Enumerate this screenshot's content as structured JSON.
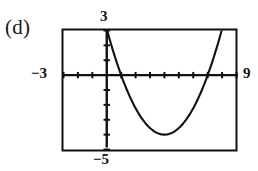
{
  "figure": {
    "part_label": "(d)",
    "type": "graphing-calculator-window"
  },
  "axis_labels": {
    "x_min": "−3",
    "x_max": "9",
    "y_max": "3",
    "y_min": "−5"
  },
  "colors": {
    "ink": "#111111",
    "background": "#ffffff",
    "curve": "#111111"
  },
  "chart_data": {
    "type": "line",
    "title": "",
    "subtitle": "",
    "xlabel": "",
    "ylabel": "",
    "xlim": [
      -3,
      9
    ],
    "ylim": [
      -5,
      3
    ],
    "grid": false,
    "legend": null,
    "x_tick_step": 1,
    "y_tick_step": 1,
    "x_ticks": [
      -3,
      -2,
      -1,
      0,
      1,
      2,
      3,
      4,
      5,
      6,
      7,
      8,
      9
    ],
    "y_ticks": [
      -5,
      -4,
      -3,
      -2,
      -1,
      0,
      1,
      2,
      3
    ],
    "series": [
      {
        "name": "parabola",
        "shape": "upward-parabola",
        "vertex": [
          4,
          -4
        ],
        "roots": [
          1,
          7
        ],
        "leading_coefficient": 0.444,
        "equation": "y = 0.444(x - 4)^2 - 4",
        "x": [
          -0.2,
          0.0,
          0.3,
          0.6,
          1.0,
          1.4,
          1.8,
          2.2,
          2.6,
          3.0,
          3.4,
          3.8,
          4.0,
          4.2,
          4.6,
          5.0,
          5.4,
          5.8,
          6.2,
          6.6,
          7.0,
          7.4,
          7.8,
          8.0
        ],
        "y": [
          4.39,
          3.11,
          2.58,
          1.53,
          0.0,
          -0.89,
          -1.85,
          -2.56,
          -3.13,
          -3.56,
          -3.84,
          -3.98,
          -4.0,
          -3.98,
          -3.84,
          -3.56,
          -3.13,
          -2.56,
          -1.85,
          -0.89,
          0.0,
          1.53,
          2.58,
          3.11
        ]
      }
    ],
    "annotations": [
      {
        "text": "−3",
        "position": "left-of-axis",
        "value": -3
      },
      {
        "text": "9",
        "position": "right-of-axis",
        "value": 9
      },
      {
        "text": "3",
        "position": "above-y-axis",
        "value": 3
      },
      {
        "text": "−5",
        "position": "below-y-axis",
        "value": -5
      }
    ]
  }
}
